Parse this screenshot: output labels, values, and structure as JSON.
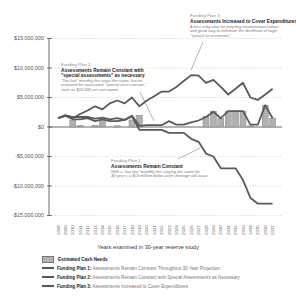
{
  "chart_data": {
    "type": "line",
    "title": "",
    "xlabel": "Years examined in 30-year reserve study",
    "ylabel": "",
    "ylim": [
      -15000000,
      15000000
    ],
    "yticks": [
      "$15,000,000",
      "$10,000,000",
      "$5,000,000",
      "$0",
      "-$5,000,000",
      "-$10,000,000",
      "-$15,000,000"
    ],
    "grid": "dotted horizontal",
    "x": [
      2008,
      2009,
      2010,
      2011,
      2012,
      2013,
      2014,
      2015,
      2016,
      2017,
      2018,
      2019,
      2020,
      2021,
      2022,
      2023,
      2024,
      2025,
      2026,
      2027,
      2028,
      2029,
      2030,
      2031,
      2032,
      2033,
      2034,
      2035,
      2036,
      2037
    ],
    "series": [
      {
        "name": "Estimated Cash Needs",
        "kind": "bar",
        "values": [
          0,
          0,
          1200000,
          300000,
          0,
          300000,
          1100000,
          0,
          200000,
          0,
          1200000,
          2000000,
          0,
          0,
          0,
          0,
          0,
          0,
          0,
          0,
          1800000,
          2700000,
          1500000,
          2700000,
          2700000,
          2700000,
          200000,
          0,
          3700000,
          1500000
        ]
      },
      {
        "name": "Funding Plan 1: Assessments Remain Constant Throughout 30-Year Projection",
        "kind": "line",
        "values": [
          1500000,
          1900000,
          1300000,
          1300000,
          1500000,
          1000000,
          1300000,
          1000000,
          1000000,
          1200000,
          1800000,
          -500000,
          -500000,
          -500000,
          -500000,
          -1000000,
          -1000000,
          -1000000,
          -2000000,
          -2500000,
          -4500000,
          -5000000,
          -7000000,
          -7000000,
          -7000000,
          -9000000,
          -12000000,
          -13000000,
          -13000000,
          -13000000
        ]
      },
      {
        "name": "Funding Plan 2: Assessments Remain Constant with Special Assessments as Necessary",
        "kind": "line",
        "values": [
          1500000,
          2000000,
          1700000,
          1700000,
          1700000,
          1400000,
          1600000,
          1300000,
          1500000,
          1200000,
          1900000,
          200000,
          300000,
          300000,
          300000,
          1000000,
          400000,
          400000,
          800000,
          1100000,
          1700000,
          2600000,
          1500000,
          2700000,
          2700000,
          2700000,
          400000,
          400000,
          3700000,
          1500000
        ]
      },
      {
        "name": "Funding Plan 3: Assessments Increased to Cover Expenditures",
        "kind": "line",
        "values": [
          1500000,
          1900000,
          1500000,
          2200000,
          2800000,
          3500000,
          3000000,
          4000000,
          4500000,
          4000000,
          5000000,
          3500000,
          4500000,
          5200000,
          6000000,
          6000000,
          6800000,
          7800000,
          8800000,
          8700000,
          7500000,
          8000000,
          6800000,
          5500000,
          6500000,
          7500000,
          5000000,
          4600000,
          5500000,
          6500000
        ]
      }
    ],
    "annotations": [
      {
        "id": "plan3",
        "heading": "Funding Plan 3:",
        "title": "Assessments Increased to Cover Expenditures",
        "body": "A less risky plan for property maintenance/values and good way to minimize the likelihood of large \"special assessments\""
      },
      {
        "id": "plan2",
        "heading": "Funding Plan 2:",
        "title": "Assessments Remain Constant with \"special assessments\" as necessary",
        "body": "\"Too low\" monthly fee stays the same, but be prepared for occasional \"special assessments,\" such as $10,000 per unit owner"
      },
      {
        "id": "plan1",
        "heading": "Funding Plan 1:",
        "title": "Assessments Remain Constant",
        "body": "With a \"too low\" monthly fee staying the same for 30 years, a $13 million dollar cash shortage will occur"
      }
    ],
    "legend": [
      {
        "swatch": "box",
        "bold": "Estimated Cash Needs",
        "desc": ""
      },
      {
        "swatch": "line",
        "bold": "Funding Plan 1:",
        "desc": " Assessments Remain Constant Throughout 30-Year Projection"
      },
      {
        "swatch": "line",
        "bold": "Funding Plan 2:",
        "desc": " Assessments Remain Constant with Special Assessments as Necessary"
      },
      {
        "swatch": "line",
        "bold": "Funding Plan 3:",
        "desc": " Assessments Increased to Cover Expenditures"
      }
    ],
    "legend_position": "bottom-left",
    "colors": {
      "line": "#5a5a5a",
      "bar": "#b0b0b0",
      "bar_edge": "#777777",
      "grid": "#bdbdbd",
      "axis": "#444444"
    }
  }
}
